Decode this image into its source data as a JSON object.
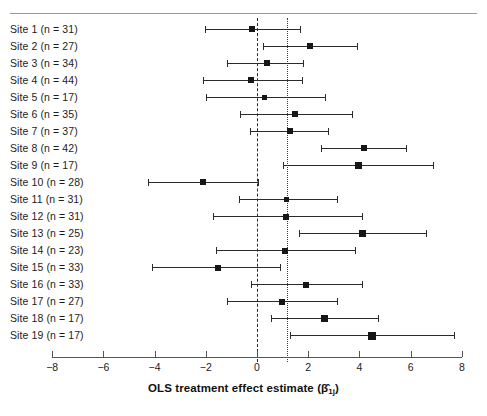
{
  "figure": {
    "type": "forest-plot",
    "background_color": "#ffffff",
    "point_color": "#161616",
    "line_color": "#2b2b2b"
  },
  "axis": {
    "title_prefix": "OLS treatment effect estimate (",
    "title_beta": "β",
    "title_hat": "̂",
    "title_sub": "1j",
    "title_suffix": ")",
    "title_full": "OLS treatment effect estimate (β̂₁ⱼ)",
    "xlim": [
      -8,
      8
    ],
    "ticks": [
      -8,
      -6,
      -4,
      -2,
      0,
      2,
      4,
      6,
      8
    ],
    "ticklabels": [
      "−8",
      "−6",
      "−4",
      "−2",
      "0",
      "2",
      "4",
      "6",
      "8"
    ]
  },
  "reference_lines": [
    {
      "name": "zero-line",
      "value": 0,
      "style": "dashed"
    },
    {
      "name": "pooled-estimate-line",
      "value": 1.18,
      "style": "dotted"
    }
  ],
  "chart_data": {
    "type": "scatter",
    "subtype": "forest-plot",
    "title": "",
    "xlabel": "OLS treatment effect estimate (β̂₁ⱼ)",
    "ylabel": "",
    "xlim": [
      -8,
      8
    ],
    "xticks": [
      -8,
      -6,
      -4,
      -2,
      0,
      2,
      4,
      6,
      8
    ],
    "grid": false,
    "legend": "none",
    "annotations": [
      {
        "label": "zero reference (dashed)",
        "x": 0
      },
      {
        "label": "pooled estimate (dotted)",
        "x": 1.18
      }
    ],
    "categories": [
      "Site 1 (n = 31)",
      "Site 2 (n = 27)",
      "Site 3 (n = 34)",
      "Site 4 (n = 44)",
      "Site 5 (n = 17)",
      "Site 6 (n = 35)",
      "Site 7 (n = 37)",
      "Site 8 (n = 42)",
      "Site 9 (n = 17)",
      "Site 10 (n = 28)",
      "Site 11 (n = 31)",
      "Site 12 (n = 31)",
      "Site 13 (n = 25)",
      "Site 14 (n = 23)",
      "Site 15 (n = 33)",
      "Site 16 (n = 33)",
      "Site 17 (n = 27)",
      "Site 18 (n = 17)",
      "Site 19 (n = 17)"
    ],
    "estimates": [
      -0.2,
      2.07,
      0.39,
      -0.23,
      0.31,
      1.48,
      1.29,
      4.18,
      3.95,
      -2.1,
      1.17,
      1.13,
      4.14,
      1.09,
      -1.52,
      1.9,
      0.96,
      2.64,
      4.5
    ],
    "ci_low": [
      -2.03,
      0.23,
      -1.17,
      -2.11,
      -1.99,
      -0.66,
      -0.27,
      2.5,
      1.0,
      -4.25,
      -0.7,
      -1.72,
      1.64,
      -1.6,
      -4.1,
      -0.25,
      -1.18,
      0.53,
      1.29
    ],
    "ci_high": [
      1.68,
      3.9,
      1.8,
      1.76,
      2.66,
      3.71,
      2.77,
      5.82,
      6.88,
      0.04,
      3.13,
      4.1,
      6.6,
      3.83,
      0.9,
      4.1,
      3.12,
      4.73,
      7.7
    ],
    "n": [
      31,
      27,
      34,
      44,
      17,
      35,
      37,
      42,
      17,
      28,
      31,
      31,
      25,
      23,
      33,
      33,
      27,
      17,
      17
    ]
  },
  "rows": [
    {
      "label": "Site 1 (n = 31)",
      "est": -0.2,
      "low": -2.03,
      "high": 1.68,
      "size": 6
    },
    {
      "label": "Site 2 (n = 27)",
      "est": 2.07,
      "low": 0.23,
      "high": 3.9,
      "size": 6
    },
    {
      "label": "Site 3 (n = 34)",
      "est": 0.39,
      "low": -1.17,
      "high": 1.8,
      "size": 6
    },
    {
      "label": "Site 4 (n = 44)",
      "est": -0.23,
      "low": -2.11,
      "high": 1.76,
      "size": 6
    },
    {
      "label": "Site 5 (n = 17)",
      "est": 0.31,
      "low": -1.99,
      "high": 2.66,
      "size": 5
    },
    {
      "label": "Site 6 (n = 35)",
      "est": 1.48,
      "low": -0.66,
      "high": 3.71,
      "size": 6
    },
    {
      "label": "Site 7 (n = 37)",
      "est": 1.29,
      "low": -0.27,
      "high": 2.77,
      "size": 6
    },
    {
      "label": "Site 8 (n = 42)",
      "est": 4.18,
      "low": 2.5,
      "high": 5.82,
      "size": 6
    },
    {
      "label": "Site 9 (n = 17)",
      "est": 3.95,
      "low": 1.0,
      "high": 6.88,
      "size": 7
    },
    {
      "label": "Site 10 (n = 28)",
      "est": -2.1,
      "low": -4.25,
      "high": 0.04,
      "size": 6
    },
    {
      "label": "Site 11 (n = 31)",
      "est": 1.17,
      "low": -0.7,
      "high": 3.13,
      "size": 5
    },
    {
      "label": "Site 12 (n = 31)",
      "est": 1.13,
      "low": -1.72,
      "high": 4.1,
      "size": 6
    },
    {
      "label": "Site 13 (n = 25)",
      "est": 4.14,
      "low": 1.64,
      "high": 6.6,
      "size": 7
    },
    {
      "label": "Site 14 (n = 23)",
      "est": 1.09,
      "low": -1.6,
      "high": 3.83,
      "size": 6
    },
    {
      "label": "Site 15 (n = 33)",
      "est": -1.52,
      "low": -4.1,
      "high": 0.9,
      "size": 6
    },
    {
      "label": "Site 16 (n = 33)",
      "est": 1.9,
      "low": -0.25,
      "high": 4.1,
      "size": 6
    },
    {
      "label": "Site 17 (n = 27)",
      "est": 0.96,
      "low": -1.18,
      "high": 3.12,
      "size": 6
    },
    {
      "label": "Site 18 (n = 17)",
      "est": 2.64,
      "low": 0.53,
      "high": 4.73,
      "size": 7
    },
    {
      "label": "Site 19 (n = 17)",
      "est": 4.5,
      "low": 1.29,
      "high": 7.7,
      "size": 8
    }
  ]
}
